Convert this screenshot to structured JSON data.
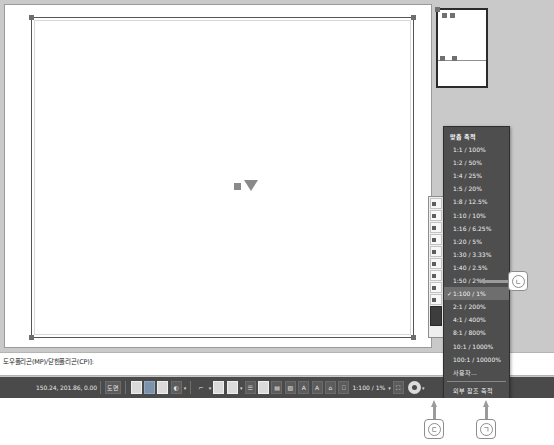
{
  "scale_menu": {
    "header": "맞춤 축척",
    "items": [
      {
        "label": "1:1 / 100%",
        "checked": false
      },
      {
        "label": "1:2 / 50%",
        "checked": false
      },
      {
        "label": "1:4 / 25%",
        "checked": false
      },
      {
        "label": "1:5 / 20%",
        "checked": false
      },
      {
        "label": "1:8 / 12.5%",
        "checked": false
      },
      {
        "label": "1:10 / 10%",
        "checked": false
      },
      {
        "label": "1:16 / 6.25%",
        "checked": false
      },
      {
        "label": "1:20 / 5%",
        "checked": false
      },
      {
        "label": "1:30 / 3.33%",
        "checked": false
      },
      {
        "label": "1:40 / 2.5%",
        "checked": false
      },
      {
        "label": "1:50 / 2%",
        "checked": false
      },
      {
        "label": "1:100 / 1%",
        "checked": true
      },
      {
        "label": "2:1 / 200%",
        "checked": false
      },
      {
        "label": "4:1 / 400%",
        "checked": false
      },
      {
        "label": "8:1 / 800%",
        "checked": false
      },
      {
        "label": "10:1 / 1000%",
        "checked": false
      },
      {
        "label": "100:1 / 10000%",
        "checked": false
      },
      {
        "label": "사용자...",
        "checked": false
      }
    ],
    "footer_items": [
      {
        "label": "외부 참조 축척",
        "checked": false
      },
      {
        "label": "퍼센트",
        "checked": true
      }
    ]
  },
  "command_line": {
    "prompt": "도우폴리곤(MP)/닫힌폴리곤(CP)]:"
  },
  "status_bar": {
    "coordinates": "150.24, 201.86, 0.00",
    "model_label": "도면",
    "scale_value": "1:100 / 1%",
    "gear_icon": "gear-icon",
    "caret_icon": "chevron-down-icon"
  },
  "callouts": {
    "right": "ㄴ",
    "bottom_left": "ㄷ",
    "bottom_right": "ㄱ"
  },
  "colors": {
    "menu_bg": "#4e4e4e",
    "menu_selected": "#6e6e6e",
    "status_bg": "#4a4a4a",
    "app_bg": "#c9c9c9",
    "canvas": "#ffffff"
  }
}
